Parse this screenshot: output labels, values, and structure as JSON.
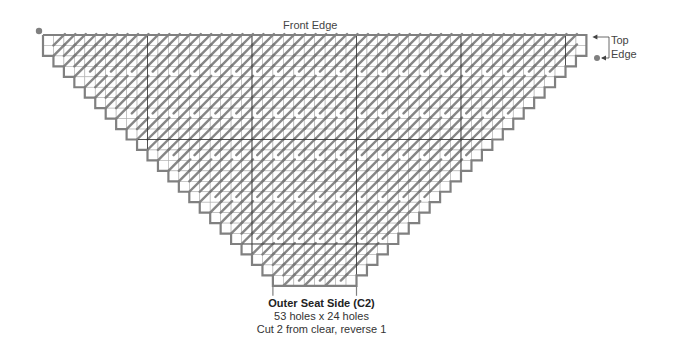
{
  "labels": {
    "front_edge": "Front Edge",
    "top_edge_line1": "Top",
    "top_edge_line2": "Edge"
  },
  "caption": {
    "title": "Outer Seat Side (C2)",
    "dimensions": "53 holes x 24 holes",
    "instructions": "Cut 2 from clear, reverse 1"
  },
  "grid": {
    "holes_wide": 53,
    "holes_high": 24,
    "left": 43,
    "top": 35,
    "cell": 10.45,
    "rows": 24,
    "cols": 52,
    "full_width_rows": 2,
    "heavy_divider_every": 10,
    "colors": {
      "outline": "#808080",
      "gridline": "#b0b0b0",
      "divider": "#333333",
      "stitch": "#7a7a7a",
      "marker": "#808080"
    }
  }
}
